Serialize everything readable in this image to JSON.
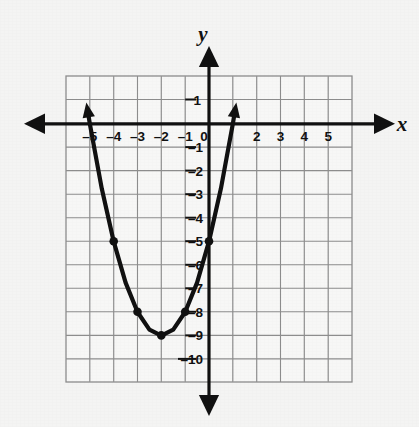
{
  "figure": {
    "background_color": "#f4f4f3",
    "grid_fill_color": "#f7f7f6",
    "grid_line_color": "#8d8d8d",
    "grid_minor_color": "#c9c9c9",
    "axis_color": "#111111",
    "curve_color": "#111111"
  },
  "axes": {
    "x_axis_label": "x",
    "y_axis_label": "y",
    "x_tick_labels": [
      "–5",
      "–4",
      "–3",
      "–2",
      "–1",
      "2",
      "3",
      "4",
      "5"
    ],
    "y_tick_labels": [
      "1",
      "0",
      "–1",
      "–2",
      "–3",
      "–4",
      "–5",
      "–6",
      "–7",
      "–8",
      "–9",
      "–10"
    ],
    "origin_label": "0"
  },
  "chart_data": {
    "type": "line",
    "title": "",
    "xlabel": "x",
    "ylabel": "y",
    "xlim": [
      -6,
      6
    ],
    "ylim": [
      -11,
      2
    ],
    "grid": true,
    "legend": "none",
    "equation": "y = (x + 2)^2 - 9",
    "vertex": [
      -2,
      -9
    ],
    "x_intercepts": [
      -5,
      1
    ],
    "y_intercept": -5,
    "series": [
      {
        "name": "parabola",
        "marked_points": [
          {
            "x": -4,
            "y": -5
          },
          {
            "x": -3,
            "y": -8
          },
          {
            "x": -2,
            "y": -9
          },
          {
            "x": -1,
            "y": -8
          },
          {
            "x": 0,
            "y": -5
          }
        ],
        "x": [
          -5.1,
          -5.0,
          -4.5,
          -4.0,
          -3.5,
          -3.0,
          -2.5,
          -2.0,
          -1.5,
          -1.0,
          -0.5,
          0.0,
          0.5,
          1.0,
          1.1
        ],
        "y": [
          0.61,
          0.0,
          -2.75,
          -5.0,
          -6.75,
          -8.0,
          -8.75,
          -9.0,
          -8.75,
          -8.0,
          -6.75,
          -5.0,
          -2.75,
          0.0,
          0.61
        ]
      }
    ],
    "x_ticks": [
      -5,
      -4,
      -3,
      -2,
      -1,
      0,
      1,
      2,
      3,
      4,
      5
    ],
    "y_ticks": [
      1,
      0,
      -1,
      -2,
      -3,
      -4,
      -5,
      -6,
      -7,
      -8,
      -9,
      -10
    ],
    "grid_x_range": [
      -6,
      6
    ],
    "grid_y_range": [
      -11,
      2
    ]
  }
}
